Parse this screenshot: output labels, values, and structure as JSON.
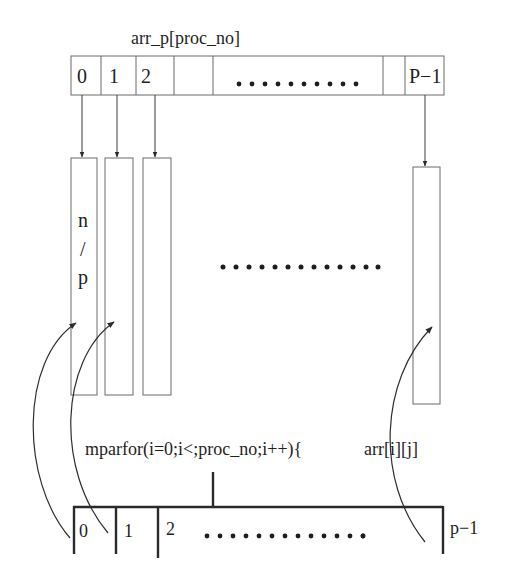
{
  "diagram": {
    "top_array": {
      "label": "arr_p[proc_no]",
      "cells": [
        "0",
        "1",
        "2",
        "",
        "",
        "",
        "P−1"
      ],
      "ellipsis_dots": 10
    },
    "columns": {
      "first_label": [
        "n",
        "/",
        "p"
      ],
      "middle_ellipsis_dots": 13
    },
    "loop": {
      "code": "mparfor(i=0;i<;proc_no;i++){",
      "access": "arr[i][j]"
    },
    "bottom_array": {
      "cells": [
        "0",
        "1",
        "2"
      ],
      "last_label": "p−1",
      "ellipsis_dots": 14
    },
    "colors": {
      "ink": "#1e1e1e",
      "thin_line": "#6a6a6a",
      "background": "#ffffff"
    }
  }
}
